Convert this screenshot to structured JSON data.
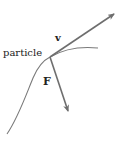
{
  "diagram": {
    "labels": {
      "particle": "particle",
      "velocity": "v",
      "force": "F"
    },
    "colors": {
      "curve": "#7a7a7a",
      "arrow": "#6e6e6e",
      "text": "#222222",
      "background": "#ffffff"
    },
    "points": {
      "particle": [
        50,
        57
      ],
      "velocity_tip": [
        115,
        13
      ],
      "force_tip": [
        69,
        113
      ]
    }
  }
}
